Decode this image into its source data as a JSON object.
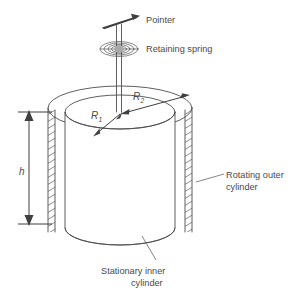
{
  "figure": {
    "type": "engineering-diagram",
    "background_color": "#ffffff",
    "line_color": "#4d4d4d",
    "text_color": "#4a4a4a"
  },
  "labels": {
    "pointer": "Pointer",
    "retaining_spring": "Retaining spring",
    "rotating_outer_cylinder_line1": "Rotating outer",
    "rotating_outer_cylinder_line2": "cylinder",
    "stationary_inner_cylinder_line1": "Stationary inner",
    "stationary_inner_cylinder_line2": "cylinder"
  },
  "dimensions": {
    "height_symbol": "h",
    "inner_radius_symbol": "R",
    "inner_radius_subscript": "1",
    "outer_radius_symbol": "R",
    "outer_radius_subscript": "2"
  },
  "parts": {
    "shaft": "vertical-shaft",
    "spring": "flat-spiral-spring",
    "pointer_needle": "needle-pointer",
    "inner_cylinder": "stationary-inner-cylinder",
    "outer_cylinder": "rotating-outer-cylinder",
    "left_wall_hatch": "outer-wall-section-left",
    "right_wall_hatch": "outer-wall-section-right"
  }
}
